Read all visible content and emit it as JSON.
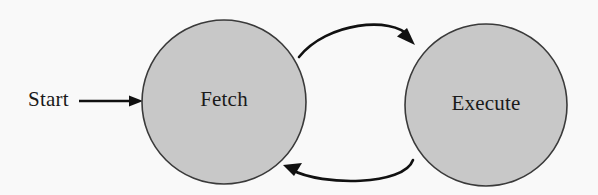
{
  "diagram": {
    "type": "state-transition-diagram",
    "background_color": "#f9f9f9",
    "node_fill_color": "#c8c8c8",
    "node_stroke_color": "#3a3a3a",
    "edge_color": "#111111",
    "text_color": "#1a1a1a",
    "entry_point": {
      "label": "Start",
      "name": "start-label",
      "x": 28,
      "y": 101,
      "arrow": {
        "name": "start-arrow",
        "from_x": 79,
        "to_x": 143,
        "y": 101,
        "style": "straight"
      }
    },
    "nodes": [
      {
        "id": "fetch",
        "label": "Fetch",
        "cx": 224,
        "cy": 102,
        "r": 82,
        "fill": "#c8c8c8"
      },
      {
        "id": "execute",
        "label": "Execute",
        "cx": 486,
        "cy": 105,
        "r": 81,
        "fill": "#c8c8c8"
      }
    ],
    "edges": [
      {
        "id": "fetch-to-execute",
        "name": "edge-fetch-to-execute",
        "from": "fetch",
        "to": "execute",
        "label": "",
        "style": "curved",
        "direction": "top",
        "path": "M 299,57 C 330,23 400,18 414,41",
        "arrow_at": "execute"
      },
      {
        "id": "execute-to-fetch",
        "name": "edge-execute-to-fetch",
        "from": "execute",
        "to": "fetch",
        "label": "",
        "style": "curved",
        "direction": "bottom",
        "path": "M 412,161 C 400,186 320,185 287,167",
        "arrow_at": "fetch"
      }
    ]
  }
}
